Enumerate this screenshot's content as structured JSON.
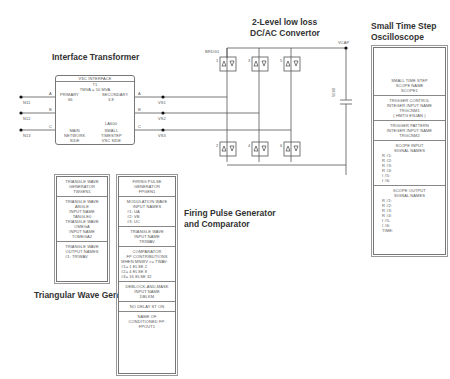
{
  "labels": {
    "interface_transformer": "Interface Transformer",
    "converter_line1": "2-Level low loss",
    "converter_line2": "DC/AC Convertor",
    "oscilloscope_line1": "Small Time Step",
    "oscilloscope_line2": "Oscilloscope",
    "firing_line1": "Firing Pulse Generator",
    "firing_line2": "and Comparator",
    "triangular": "Triangular Wave Generator"
  },
  "transformer": {
    "header": "VSC INTERFACE",
    "name": "T1",
    "rating": "TMVA = 10 MVA",
    "primary_label": "PRIMARY",
    "primary_value": "66",
    "secondary_label": "SECONDARY",
    "secondary_value": "3.8",
    "delta_label": "LA600",
    "left_text": [
      "MAIN",
      "NETWORK",
      "SIDE"
    ],
    "right_text": [
      "SMALL",
      "TIMESTEP",
      "VSC SIDE"
    ],
    "phases": [
      "A",
      "B",
      "C"
    ],
    "input_nodes": [
      "N11",
      "N12",
      "N13"
    ]
  },
  "converter": {
    "bridge_name": "BRDG1",
    "upper_switches": [
      "1",
      "3",
      "5"
    ],
    "lower_switches": [
      "2",
      "4",
      "6"
    ],
    "ac_nodes": [
      "VS1",
      "VS2",
      "VS3"
    ],
    "dc_node": "VCAP",
    "capacitor_value": "5000",
    "capacitor_unit": "[uF]"
  },
  "oscilloscope": {
    "scope_text": [
      "SMALL TIME STEP",
      "SCOPE NAME",
      "SCOPE1"
    ],
    "trigger_control": [
      "TRIGGER CONTROL",
      "INTEGER INPUT NAME",
      "TRGCNM1",
      "( Hmtg enjan )"
    ],
    "trigger_pattern": [
      "TRIGGER PATTERN",
      "INTEGER INPUT NAME",
      "TRGCNM2"
    ],
    "scope_input_title": [
      "SCOPE INPUT",
      "SIGNAL NAMES"
    ],
    "scope_inputs": [
      "R  #1:",
      "R  #2:",
      "R  #3:",
      "R  #4:",
      "I   #5:",
      "I   #6:"
    ],
    "scope_output_title": [
      "SCOPE OUTPUT",
      "SIGNAL NAMES"
    ],
    "scope_outputs": [
      "R  #1:",
      "R  #2:",
      "R  #3:",
      "R  #4:",
      "I   #5:",
      "I   #6:",
      "TIME:"
    ]
  },
  "triangle_gen": {
    "sec1": [
      "TRIANGLE WAVE",
      "GENERATOR",
      "TWGEN1"
    ],
    "sec2": [
      "TRIANGLE WAVE",
      "ANGLE",
      "INPUT NAME",
      "TANGLE0",
      "TRIANGLE WAVE",
      "OMEGA",
      "INPUT NAME",
      "TOMEGA2"
    ],
    "sec3": [
      "TRIANGLE WAVE",
      "OUTPUT NAMES"
    ],
    "sec3_row": "#1:     TRIWAV"
  },
  "firing_gen": {
    "sec1": [
      "FIRING PULSE",
      "GENERATOR",
      "FPGEN1"
    ],
    "sec2_title": [
      "MODULATION WAVE",
      "INPUT NAMES"
    ],
    "sec2_rows": [
      "#1:        UA",
      "#2:        VB",
      "#3:        UC"
    ],
    "sec3": [
      "TRIANGLE WAVE",
      "INPUT NAME",
      "TRIWAV"
    ],
    "sec4_title": [
      "COMPARATOR",
      "FP CONTRIBUTIONS"
    ],
    "sec4_rows": [
      "WHEN MNWV >= TWAV:",
      "#1=   1  ELSE   2",
      "#2=   4  ELSE   8",
      "#3=  16  ELSE  32"
    ],
    "sec5": [
      "DEBLOCK-AND-MASK",
      "INPUT NAME",
      "DBLKM"
    ],
    "sec6": [
      "NO DELAY ST ON"
    ],
    "sec7": [
      "NAME OF",
      "CONDITIONED FP:",
      "FPOUT1"
    ]
  }
}
